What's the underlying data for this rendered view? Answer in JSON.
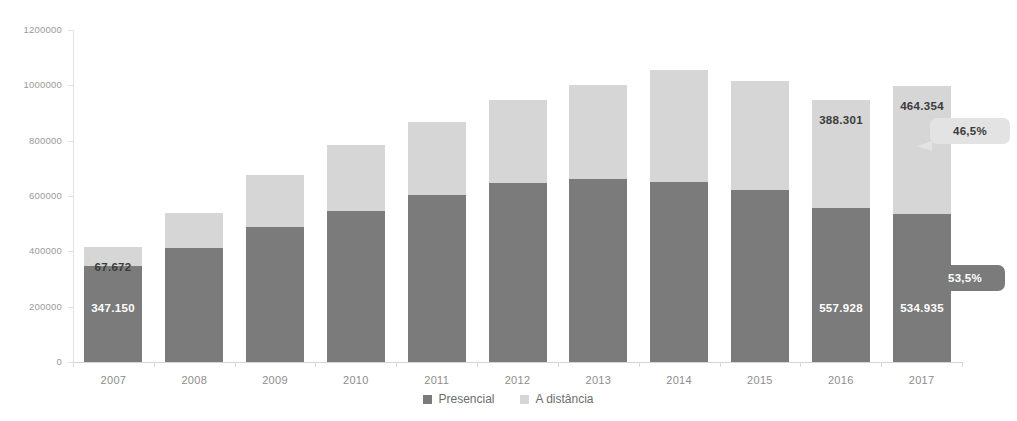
{
  "chart_data": {
    "type": "bar",
    "stacked": true,
    "title": "",
    "xlabel": "",
    "ylabel": "",
    "ylim": [
      0,
      1200000
    ],
    "ytick_labels": [
      "0",
      "200000",
      "400000",
      "600000",
      "800000",
      "1000000",
      "1200000"
    ],
    "ytick_values": [
      0,
      200000,
      400000,
      600000,
      800000,
      1000000,
      1200000
    ],
    "grid": false,
    "legend_position": "bottom",
    "categories": [
      "2007",
      "2008",
      "2009",
      "2010",
      "2011",
      "2012",
      "2013",
      "2014",
      "2015",
      "2016",
      "2017"
    ],
    "series": [
      {
        "name": "Presencial",
        "color": "#7b7b7b",
        "values": [
          347150,
          412000,
          487000,
          545000,
          604000,
          646000,
          663000,
          649000,
          621000,
          557928,
          534935
        ]
      },
      {
        "name": "A distância",
        "color": "#d6d6d6",
        "values": [
          67672,
          125000,
          190000,
          240000,
          265000,
          300000,
          340000,
          406000,
          394000,
          388301,
          464354
        ]
      }
    ],
    "point_labels": [
      {
        "category": "2007",
        "series": "A distância",
        "text": "67.672"
      },
      {
        "category": "2007",
        "series": "Presencial",
        "text": "347.150"
      },
      {
        "category": "2016",
        "series": "A distância",
        "text": "388.301"
      },
      {
        "category": "2016",
        "series": "Presencial",
        "text": "557.928"
      },
      {
        "category": "2017",
        "series": "A distância",
        "text": "464.354"
      },
      {
        "category": "2017",
        "series": "Presencial",
        "text": "534.935"
      }
    ],
    "annotations": [
      {
        "text": "46,5%",
        "style": "light",
        "points_to": "2017 A distância"
      },
      {
        "text": "53,5%",
        "style": "dark",
        "points_to": "2017 Presencial"
      }
    ]
  },
  "legend": {
    "items": [
      {
        "label": "Presencial",
        "color": "#7b7b7b"
      },
      {
        "label": "A distância",
        "color": "#d6d6d6"
      }
    ]
  }
}
